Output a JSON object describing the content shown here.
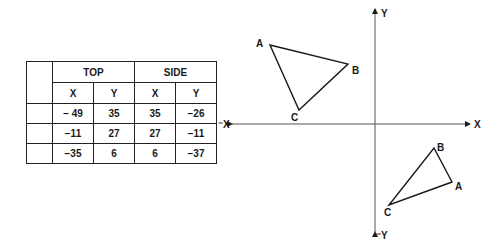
{
  "table": {
    "groups": [
      "TOP",
      "SIDE"
    ],
    "subheaders": [
      "X",
      "Y",
      "X",
      "Y"
    ],
    "rows": [
      [
        "− 49",
        "35",
        "35",
        "−26"
      ],
      [
        "−11",
        "27",
        "27",
        "−11"
      ],
      [
        "−35",
        "6",
        "6",
        "−37"
      ]
    ]
  },
  "axes": {
    "x_pos_label": "X",
    "x_neg_label": "⁻X",
    "y_pos_label": "Y",
    "y_neg_label": "⁻Y"
  },
  "triangles": {
    "top": {
      "vertices": [
        {
          "label": "A",
          "x": 270,
          "y": 45
        },
        {
          "label": "B",
          "x": 348,
          "y": 64
        },
        {
          "label": "C",
          "x": 299,
          "y": 110
        }
      ]
    },
    "side": {
      "vertices": [
        {
          "label": "A",
          "x": 452,
          "y": 182
        },
        {
          "label": "B",
          "x": 434,
          "y": 148
        },
        {
          "label": "C",
          "x": 389,
          "y": 205
        }
      ]
    }
  },
  "colors": {
    "ink": "#1a1a1a",
    "background": "#ffffff"
  }
}
